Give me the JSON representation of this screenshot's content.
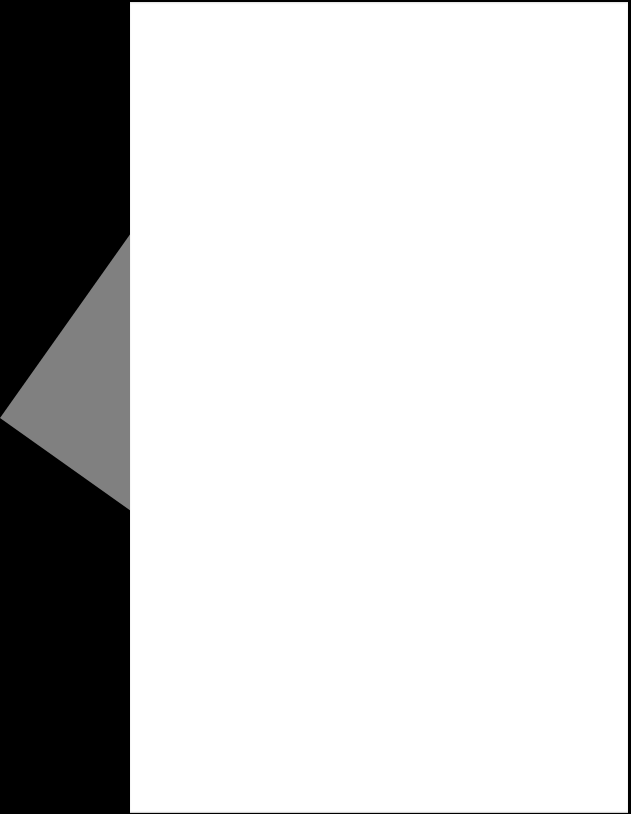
{
  "scene": {
    "description": "Blank white sheet of paper on a black background with a gray triangular shape at the left edge",
    "background_color": "#000000",
    "sheet_color": "#ffffff",
    "triangle_color": "#808080"
  }
}
